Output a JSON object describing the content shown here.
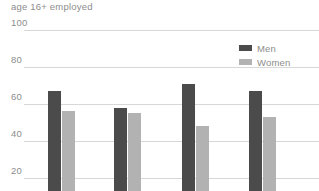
{
  "chart_data": {
    "type": "bar",
    "title": "age 16+ employed",
    "xlabel": "",
    "ylabel": "",
    "ylim": [
      0,
      100
    ],
    "yticks": [
      100,
      80,
      60,
      40,
      20
    ],
    "grid": true,
    "legend_position": "top-right",
    "categories": [
      "1",
      "2",
      "3",
      "4"
    ],
    "series": [
      {
        "name": "Men",
        "color": "#4b4b4b",
        "values": [
          67,
          58,
          71,
          67
        ]
      },
      {
        "name": "Women",
        "color": "#b2b2b2",
        "values": [
          56,
          55,
          48,
          53
        ]
      }
    ]
  },
  "axis": {
    "tick_labels": [
      "100",
      "80",
      "60",
      "40",
      "20"
    ]
  },
  "legend": {
    "entries": [
      {
        "label": "Men",
        "swatch": "men-swatch"
      },
      {
        "label": "Women",
        "swatch": "women-swatch"
      }
    ]
  }
}
